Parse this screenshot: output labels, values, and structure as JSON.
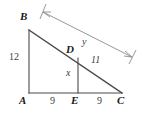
{
  "figure": {
    "stroke_color": "#4a4a4a",
    "label_color": "#1a1a1a",
    "measure_color": "#3d3d3d",
    "background": "#ffffff",
    "vertices": [
      {
        "name": "B",
        "label": "B",
        "x": 29,
        "y": 30,
        "label_x": 20,
        "label_y": 12
      },
      {
        "name": "A",
        "label": "A",
        "x": 29,
        "y": 93,
        "label_x": 20,
        "label_y": 95
      },
      {
        "name": "E",
        "label": "E",
        "x": 78,
        "y": 93,
        "label_x": 71,
        "label_y": 95
      },
      {
        "name": "C",
        "label": "C",
        "x": 122,
        "y": 93,
        "label_x": 118,
        "label_y": 95
      },
      {
        "name": "D",
        "label": "D",
        "x": 78,
        "y": 58,
        "label_x": 67,
        "label_y": 44
      }
    ],
    "segments": [
      {
        "name": "side-AB",
        "from": "A",
        "to": "B"
      },
      {
        "name": "side-AC",
        "from": "A",
        "to": "C"
      },
      {
        "name": "side-BC",
        "from": "B",
        "to": "C"
      },
      {
        "name": "altitude-DE",
        "from": "D",
        "to": "E"
      }
    ],
    "measures": [
      {
        "name": "length-ab",
        "text": "12",
        "x": 10,
        "y": 57,
        "italic": false
      },
      {
        "name": "length-ae",
        "text": "9",
        "x": 50,
        "y": 96,
        "italic": false
      },
      {
        "name": "length-ec",
        "text": "9",
        "x": 97,
        "y": 96,
        "italic": false
      },
      {
        "name": "length-de",
        "text": "x",
        "x": 66,
        "y": 68,
        "italic": true
      },
      {
        "name": "length-dc",
        "text": "11",
        "x": 92,
        "y": 56,
        "italic": true
      },
      {
        "name": "length-bd",
        "text": "y",
        "x": 82,
        "y": 38,
        "italic": true
      }
    ],
    "dimension_arrow": {
      "name": "dimension-arrow-bd",
      "label": "y",
      "from_x": 43,
      "from_y": 12,
      "to_x": 132,
      "to_y": 57
    }
  }
}
